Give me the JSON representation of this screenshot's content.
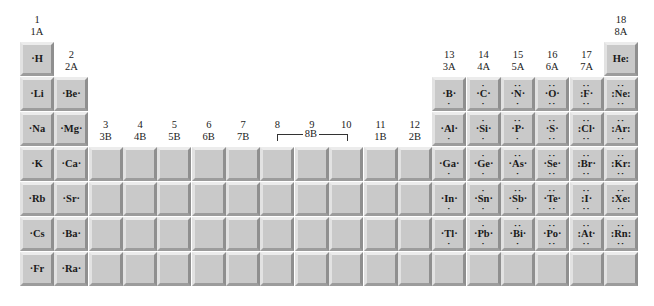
{
  "group_labels": [
    {
      "col": 1,
      "num": "1",
      "old": "1A"
    },
    {
      "col": 2,
      "num": "2",
      "old": "2A"
    },
    {
      "col": 3,
      "num": "3",
      "old": "3B"
    },
    {
      "col": 4,
      "num": "4",
      "old": "4B"
    },
    {
      "col": 5,
      "num": "5",
      "old": "5B"
    },
    {
      "col": 6,
      "num": "6",
      "old": "6B"
    },
    {
      "col": 7,
      "num": "7",
      "old": "7B"
    },
    {
      "col": 8,
      "num": "8",
      "old": ""
    },
    {
      "col": 9,
      "num": "9",
      "old": ""
    },
    {
      "col": 10,
      "num": "10",
      "old": ""
    },
    {
      "col": 11,
      "num": "11",
      "old": "1B"
    },
    {
      "col": 12,
      "num": "12",
      "old": "2B"
    },
    {
      "col": 13,
      "num": "13",
      "old": "3A"
    },
    {
      "col": 14,
      "num": "14",
      "old": "4A"
    },
    {
      "col": 15,
      "num": "15",
      "old": "5A"
    },
    {
      "col": 16,
      "num": "16",
      "old": "6A"
    },
    {
      "col": 17,
      "num": "17",
      "old": "7A"
    },
    {
      "col": 18,
      "num": "18",
      "old": "8A"
    }
  ],
  "group_8b_label": "8B",
  "elements": [
    {
      "sym": "H",
      "row": 1,
      "col": 1,
      "lewis": "·H"
    },
    {
      "sym": "He",
      "row": 1,
      "col": 18,
      "lewis": "He:"
    },
    {
      "sym": "Li",
      "row": 2,
      "col": 1,
      "lewis": "·Li"
    },
    {
      "sym": "Be",
      "row": 2,
      "col": 2,
      "lewis": "·Be·"
    },
    {
      "sym": "B",
      "row": 2,
      "col": 13,
      "lewis": "·B·",
      "dots": "b"
    },
    {
      "sym": "C",
      "row": 2,
      "col": 14,
      "lewis": "·C·",
      "dots": "tb"
    },
    {
      "sym": "N",
      "row": 2,
      "col": 15,
      "lewis": "·N·",
      "dots": "TTb"
    },
    {
      "sym": "O",
      "row": 2,
      "col": 16,
      "lewis": "·O·",
      "dots": "TTBB"
    },
    {
      "sym": "F",
      "row": 2,
      "col": 17,
      "lewis": ":F·",
      "dots": "TTBB"
    },
    {
      "sym": "Ne",
      "row": 2,
      "col": 18,
      "lewis": ":Ne:",
      "dots": "TTBB"
    },
    {
      "sym": "Na",
      "row": 3,
      "col": 1,
      "lewis": "·Na"
    },
    {
      "sym": "Mg",
      "row": 3,
      "col": 2,
      "lewis": "·Mg·"
    },
    {
      "sym": "Al",
      "row": 3,
      "col": 13,
      "lewis": "·Al·",
      "dots": "b"
    },
    {
      "sym": "Si",
      "row": 3,
      "col": 14,
      "lewis": "·Si·",
      "dots": "tb"
    },
    {
      "sym": "P",
      "row": 3,
      "col": 15,
      "lewis": "·P·",
      "dots": "TTb"
    },
    {
      "sym": "S",
      "row": 3,
      "col": 16,
      "lewis": "·S·",
      "dots": "TTBB"
    },
    {
      "sym": "Cl",
      "row": 3,
      "col": 17,
      "lewis": ":Cl·",
      "dots": "TTBB"
    },
    {
      "sym": "Ar",
      "row": 3,
      "col": 18,
      "lewis": ":Ar:",
      "dots": "TTBB"
    },
    {
      "sym": "K",
      "row": 4,
      "col": 1,
      "lewis": "·K"
    },
    {
      "sym": "Ca",
      "row": 4,
      "col": 2,
      "lewis": "·Ca·"
    },
    {
      "sym": "Ga",
      "row": 4,
      "col": 13,
      "lewis": "·Ga·",
      "dots": "b"
    },
    {
      "sym": "Ge",
      "row": 4,
      "col": 14,
      "lewis": "·Ge·",
      "dots": "tb"
    },
    {
      "sym": "As",
      "row": 4,
      "col": 15,
      "lewis": "·As·",
      "dots": "TTb"
    },
    {
      "sym": "Se",
      "row": 4,
      "col": 16,
      "lewis": "·Se·",
      "dots": "TTBB"
    },
    {
      "sym": "Br",
      "row": 4,
      "col": 17,
      "lewis": ":Br·",
      "dots": "TTBB"
    },
    {
      "sym": "Kr",
      "row": 4,
      "col": 18,
      "lewis": ":Kr:",
      "dots": "TTBB"
    },
    {
      "sym": "Rb",
      "row": 5,
      "col": 1,
      "lewis": "·Rb"
    },
    {
      "sym": "Sr",
      "row": 5,
      "col": 2,
      "lewis": "·Sr·"
    },
    {
      "sym": "In",
      "row": 5,
      "col": 13,
      "lewis": "·In·",
      "dots": "b"
    },
    {
      "sym": "Sn",
      "row": 5,
      "col": 14,
      "lewis": "·Sn·",
      "dots": "tb"
    },
    {
      "sym": "Sb",
      "row": 5,
      "col": 15,
      "lewis": "·Sb·",
      "dots": "TTb"
    },
    {
      "sym": "Te",
      "row": 5,
      "col": 16,
      "lewis": "·Te·",
      "dots": "TTBB"
    },
    {
      "sym": "I",
      "row": 5,
      "col": 17,
      "lewis": ":I·",
      "dots": "TTBB"
    },
    {
      "sym": "Xe",
      "row": 5,
      "col": 18,
      "lewis": ":Xe:",
      "dots": "TTBB"
    },
    {
      "sym": "Cs",
      "row": 6,
      "col": 1,
      "lewis": "·Cs"
    },
    {
      "sym": "Ba",
      "row": 6,
      "col": 2,
      "lewis": "·Ba·"
    },
    {
      "sym": "Tl",
      "row": 6,
      "col": 13,
      "lewis": "·Tl·",
      "dots": "b"
    },
    {
      "sym": "Pb",
      "row": 6,
      "col": 14,
      "lewis": "·Pb·",
      "dots": "tb"
    },
    {
      "sym": "Bi",
      "row": 6,
      "col": 15,
      "lewis": "·Bi·",
      "dots": "TTb"
    },
    {
      "sym": "Po",
      "row": 6,
      "col": 16,
      "lewis": "·Po·",
      "dots": "TTBB"
    },
    {
      "sym": "At",
      "row": 6,
      "col": 17,
      "lewis": ":At·",
      "dots": "TTBB"
    },
    {
      "sym": "Rn",
      "row": 6,
      "col": 18,
      "lewis": ":Rn:",
      "dots": "TTBB"
    },
    {
      "sym": "Fr",
      "row": 7,
      "col": 1,
      "lewis": "·Fr"
    },
    {
      "sym": "Ra",
      "row": 7,
      "col": 2,
      "lewis": "·Ra·"
    }
  ],
  "empty_cells": {
    "transition_rows": [
      4,
      5,
      6,
      7
    ],
    "transition_cols": [
      3,
      4,
      5,
      6,
      7,
      8,
      9,
      10,
      11,
      12
    ],
    "row7_pblock_cols": [
      13,
      14,
      15,
      16,
      17,
      18
    ]
  },
  "colors": {
    "tile": "#c9c9c9",
    "tile_highlight": "#ececec",
    "tile_shadow": "#8f8f8f",
    "text": "#1a1a1a"
  }
}
